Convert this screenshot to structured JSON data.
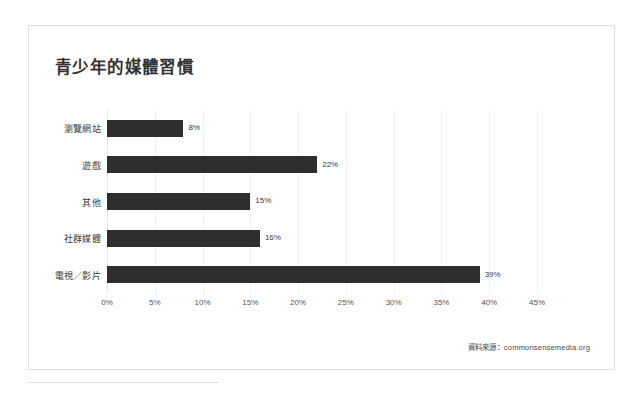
{
  "card": {
    "title": "青少年的媒體習慣",
    "source_note": "資料來源：commonsensemedia.org"
  },
  "chart_data": {
    "type": "bar",
    "orientation": "horizontal",
    "title": "青少年的媒體習慣",
    "xlabel": "",
    "ylabel": "",
    "categories": [
      "瀏覽網站",
      "遊戲",
      "其他",
      "社群媒體",
      "電視／影片"
    ],
    "values": [
      8,
      22,
      15,
      16,
      39
    ],
    "value_labels": [
      "8%",
      "22%",
      "15%",
      "16%",
      "39%"
    ],
    "xlim": [
      0,
      45
    ],
    "xticks": [
      0,
      5,
      10,
      15,
      20,
      25,
      30,
      35,
      40,
      45
    ],
    "xtick_labels": [
      "0%",
      "5%",
      "10%",
      "15%",
      "20%",
      "25%",
      "30%",
      "35%",
      "40%",
      "45%"
    ],
    "grid": true,
    "grid_axis": "x",
    "legend": false,
    "bar_color": "#2e2e2e",
    "gridline_color": "#f0f0f2",
    "axis_color": "#e6e6e8",
    "source": "資料來源：commonsensemedia.org"
  }
}
